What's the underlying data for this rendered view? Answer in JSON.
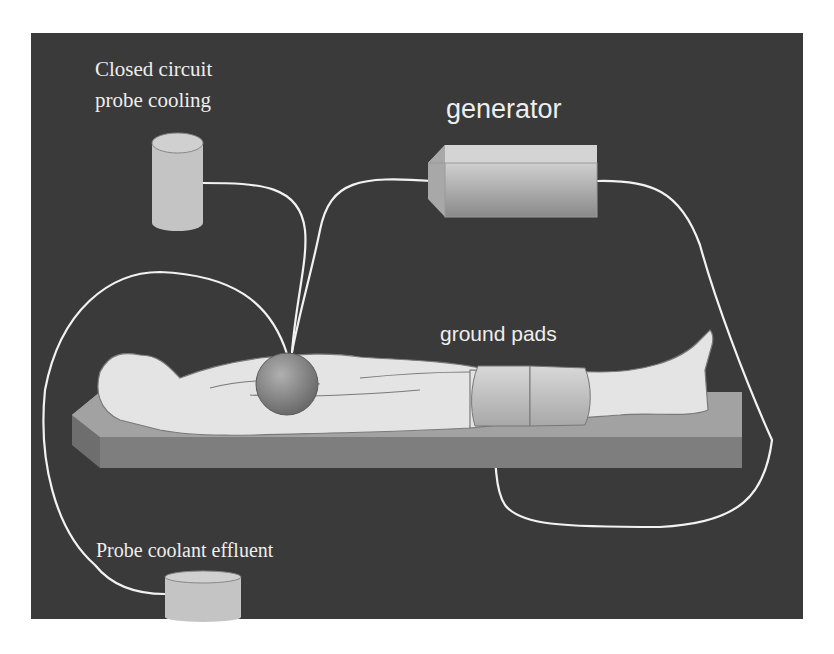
{
  "diagram": {
    "labels": {
      "cooling_line1": "Closed circuit",
      "cooling_line2": "probe cooling",
      "generator": "generator",
      "ground_pads": "ground pads",
      "effluent": "Probe coolant effluent"
    },
    "components": [
      {
        "id": "cooling-reservoir",
        "shape": "tall cylinder",
        "label_ref": "cooling"
      },
      {
        "id": "generator",
        "shape": "rectangular box",
        "label_ref": "generator"
      },
      {
        "id": "patient",
        "shape": "supine human figure on table"
      },
      {
        "id": "probe-ablation-zone",
        "shape": "sphere on upper abdomen"
      },
      {
        "id": "ground-pads",
        "shape": "two bands around thighs",
        "label_ref": "ground_pads"
      },
      {
        "id": "effluent-container",
        "shape": "short cylinder",
        "label_ref": "effluent"
      }
    ],
    "connections": [
      {
        "from": "cooling-reservoir",
        "to": "probe-ablation-zone"
      },
      {
        "from": "generator",
        "to": "probe-ablation-zone"
      },
      {
        "from": "generator",
        "to": "ground-pads"
      },
      {
        "from": "probe-ablation-zone",
        "to": "effluent-container"
      }
    ],
    "colors": {
      "background": "#3a3a3a",
      "page": "#ffffff",
      "wire": "#f2f2f2",
      "text": "#eeeeee",
      "device": "#c8c8c8",
      "table": "#9a9a9a",
      "body": "#e4e4e4"
    }
  }
}
